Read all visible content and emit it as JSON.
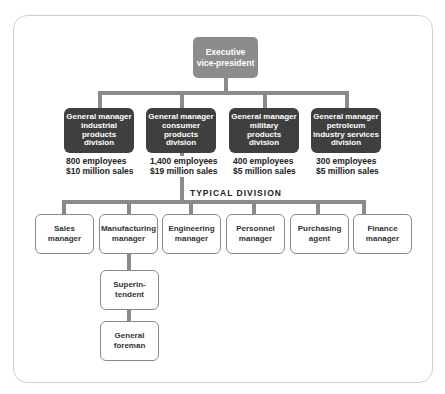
{
  "top": {
    "label": "Executive\nvice-president"
  },
  "divisions": [
    {
      "label": "General manager\nindustrial\nproducts\ndivision",
      "employees": "800 employees",
      "sales": "$10 million sales"
    },
    {
      "label": "General manager\nconsumer\nproducts\ndivision",
      "employees": "1,400 employees",
      "sales": "$19 million sales"
    },
    {
      "label": "General manager\nmilitary\nproducts\ndivision",
      "employees": "400 employees",
      "sales": "$5 million sales"
    },
    {
      "label": "General manager\npetroleum\nindustry services\ndivision",
      "employees": "300 employees",
      "sales": "$5 million sales"
    }
  ],
  "typical_division_label": "TYPICAL DIVISION",
  "managers": [
    {
      "label": "Sales\nmanager"
    },
    {
      "label": "Manufacturing\nmanager"
    },
    {
      "label": "Engineering\nmanager"
    },
    {
      "label": "Personnel\nmanager"
    },
    {
      "label": "Purchasing\nagent"
    },
    {
      "label": "Finance\nmanager"
    }
  ],
  "manufacturing_chain": [
    {
      "label": "Superin-\ntendent"
    },
    {
      "label": "General\nforeman"
    }
  ],
  "colors": {
    "exec_box": "#8c8c8c",
    "gm_box": "#3f3f3f",
    "connector": "#8a8a8a",
    "frame": "#cfcfcf"
  }
}
